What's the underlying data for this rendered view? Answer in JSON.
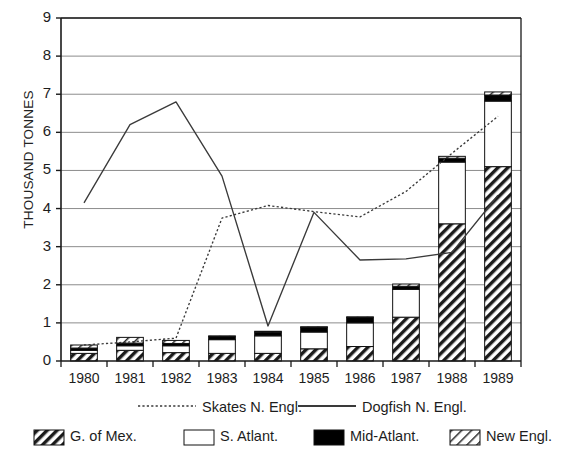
{
  "chart_data": {
    "type": "bar",
    "title": "",
    "subtitle": "",
    "xlabel": "",
    "ylabel": "THOUSAND TONNES",
    "categories": [
      "1980",
      "1981",
      "1982",
      "1983",
      "1984",
      "1985",
      "1986",
      "1987",
      "1988",
      "1989"
    ],
    "ylim": [
      0,
      9
    ],
    "yticks": [
      0,
      1,
      2,
      3,
      4,
      5,
      6,
      7,
      8,
      9
    ],
    "grid": true,
    "stacked": true,
    "legend_position": "bottom",
    "series": [
      {
        "name": "G. of Mex.",
        "kind": "bar",
        "pattern": "dense-diagonal-hatch",
        "values": [
          0.2,
          0.28,
          0.22,
          0.2,
          0.2,
          0.32,
          0.38,
          1.15,
          3.6,
          5.1
        ]
      },
      {
        "name": "S. Atlant.",
        "kind": "bar",
        "pattern": "white-solid",
        "values": [
          0.08,
          0.12,
          0.18,
          0.36,
          0.46,
          0.44,
          0.62,
          0.73,
          1.62,
          1.72
        ]
      },
      {
        "name": "Mid-Atlant.",
        "kind": "bar",
        "pattern": "black-solid",
        "values": [
          0.06,
          0.07,
          0.06,
          0.08,
          0.1,
          0.12,
          0.14,
          0.08,
          0.1,
          0.16
        ]
      },
      {
        "name": "New Engl.",
        "kind": "bar",
        "pattern": "light-diagonal-hatch",
        "values": [
          0.08,
          0.15,
          0.08,
          0.02,
          0.02,
          0.02,
          0.02,
          0.06,
          0.05,
          0.08
        ]
      },
      {
        "name": "Skates N. Engl.",
        "kind": "line",
        "style": "dotted",
        "values": [
          0.42,
          0.5,
          0.6,
          3.75,
          4.08,
          3.92,
          3.78,
          4.45,
          5.45,
          6.42
        ]
      },
      {
        "name": "Dogfish N. Engl.",
        "kind": "line",
        "style": "solid",
        "values": [
          4.15,
          6.2,
          6.8,
          4.85,
          0.92,
          3.9,
          2.65,
          2.68,
          2.85,
          4.35
        ]
      }
    ]
  },
  "legend": {
    "line_entries": [
      {
        "label": "Skates N. Engl.",
        "style": "dotted"
      },
      {
        "label": "Dogfish N. Engl.",
        "style": "solid"
      }
    ],
    "bar_entries": [
      {
        "label": "G. of Mex.",
        "pattern": "dense-diagonal-hatch"
      },
      {
        "label": "S. Atlant.",
        "pattern": "white-solid"
      },
      {
        "label": "Mid-Atlant.",
        "pattern": "black-solid"
      },
      {
        "label": "New Engl.",
        "pattern": "light-diagonal-hatch"
      }
    ]
  },
  "colors": {
    "axis": "#1a1a1a",
    "grid": "#8c8c8c",
    "bar_outline": "#111111",
    "black_fill": "#000000",
    "white_fill": "#ffffff",
    "line": "#3a3a3a",
    "background": "#ffffff"
  }
}
